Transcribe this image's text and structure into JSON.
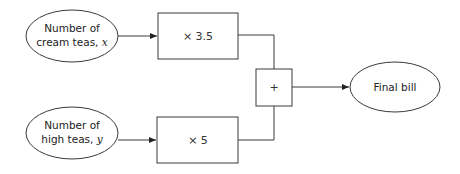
{
  "diagram": {
    "type": "flowchart",
    "nodes": {
      "input_cream": {
        "line1": "Number of",
        "line2_text": "cream teas, ",
        "line2_var": "x",
        "shape": "ellipse"
      },
      "input_high": {
        "line1": "Number of",
        "line2_text": "high teas, ",
        "line2_var": "y",
        "shape": "ellipse"
      },
      "mult_cream": {
        "label": "× 3.5",
        "shape": "rectangle"
      },
      "mult_high": {
        "label": "× 5",
        "shape": "rectangle"
      },
      "sum": {
        "label": "+",
        "shape": "rectangle"
      },
      "output": {
        "label": "Final bill",
        "shape": "ellipse"
      }
    },
    "edges": [
      {
        "from": "input_cream",
        "to": "mult_cream",
        "arrow": true
      },
      {
        "from": "input_high",
        "to": "mult_high",
        "arrow": true
      },
      {
        "from": "mult_cream",
        "to": "sum",
        "arrow": false
      },
      {
        "from": "mult_high",
        "to": "sum",
        "arrow": false
      },
      {
        "from": "sum",
        "to": "output",
        "arrow": true
      }
    ],
    "colors": {
      "stroke": "#3a3a3a",
      "text": "#222222",
      "background": "#ffffff"
    }
  }
}
